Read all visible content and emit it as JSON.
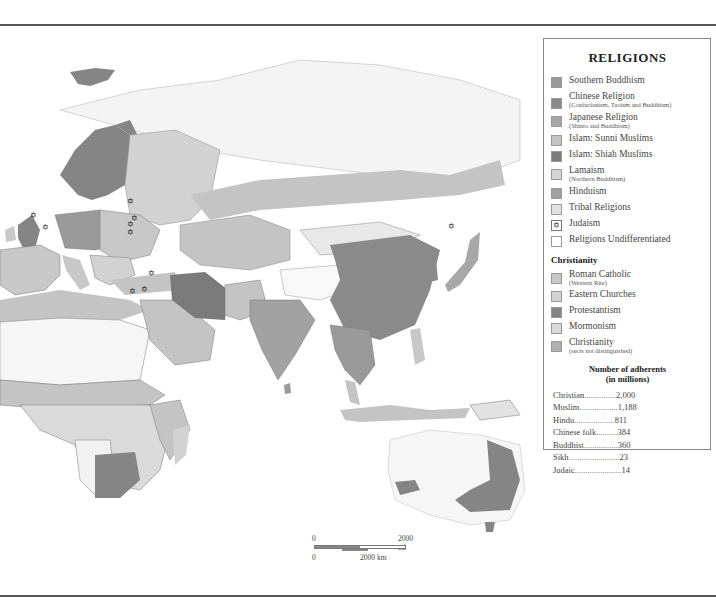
{
  "legend": {
    "title": "RELIGIONS",
    "items": [
      {
        "label": "Southern Buddhism",
        "sub": "",
        "color": "#9a9a9a",
        "icon": ""
      },
      {
        "label": "Chinese Religion",
        "sub": "(Confucianism, Taoism and Buddhism)",
        "color": "#8a8a8a",
        "icon": ""
      },
      {
        "label": "Japanese Religion",
        "sub": "(Shinto and Buddhism)",
        "color": "#a8a8a8",
        "icon": ""
      },
      {
        "label": "Islam:  Sunni Muslims",
        "sub": "",
        "color": "#c4c4c4",
        "icon": ""
      },
      {
        "label": "Islam:  Shiah Muslims",
        "sub": "",
        "color": "#7a7a7a",
        "icon": ""
      },
      {
        "label": "Lamaism",
        "sub": "(Northern Buddhism)",
        "color": "#d6d6d6",
        "icon": ""
      },
      {
        "label": "Hinduism",
        "sub": "",
        "color": "#a2a2a2",
        "icon": ""
      },
      {
        "label": "Tribal Religions",
        "sub": "",
        "color": "#e2e2e2",
        "icon": ""
      },
      {
        "label": "Judaism",
        "sub": "",
        "color": "#ffffff",
        "icon": "✡"
      },
      {
        "label": "Religions Undifferentiated",
        "sub": "",
        "color": "#ffffff",
        "icon": ""
      }
    ],
    "christianity_heading": "Christianity",
    "christianity_items": [
      {
        "label": "Roman Catholic",
        "sub": "(Western Rite)",
        "color": "#c8c8c8"
      },
      {
        "label": "Eastern Churches",
        "sub": "",
        "color": "#d2d2d2"
      },
      {
        "label": "Protestantism",
        "sub": "",
        "color": "#858585"
      },
      {
        "label": "Mormonism",
        "sub": "",
        "color": "#dadada"
      },
      {
        "label": "Christianity",
        "sub": "(sects not distinguished)",
        "color": "#b0b0b0"
      }
    ],
    "adherents_heading_1": "Number of adherents",
    "adherents_heading_2": "(in millions)",
    "adherents": [
      {
        "name": "Christian",
        "dots": " ...............",
        "value": "2,000"
      },
      {
        "name": "Muslim",
        "dots": " ..................",
        "value": "1,188"
      },
      {
        "name": "Hindu",
        "dots": " ...................",
        "value": "811"
      },
      {
        "name": "Chinese folk",
        "dots": "..........",
        "value": "384"
      },
      {
        "name": "Buddhist",
        "dots": "................",
        "value": "360"
      },
      {
        "name": "Sikh",
        "dots": "........................",
        "value": "23"
      },
      {
        "name": "Judaic",
        "dots": "......................",
        "value": "14"
      }
    ]
  },
  "scale": {
    "mi_zero": "0",
    "mi_label": "2000 mi",
    "km_zero": "0",
    "km_label": "2000 km"
  },
  "colors": {
    "protestant": "#858585",
    "catholic": "#c8c8c8",
    "eastern": "#d2d2d2",
    "sunni": "#c4c4c4",
    "shiah": "#7a7a7a",
    "chinese": "#8a8a8a",
    "hindu": "#a2a2a2",
    "tribal": "#e2e2e2",
    "lamaism": "#d6d6d6",
    "japanese": "#a8a8a8",
    "undiff": "#f4f4f4",
    "border": "#555555"
  }
}
